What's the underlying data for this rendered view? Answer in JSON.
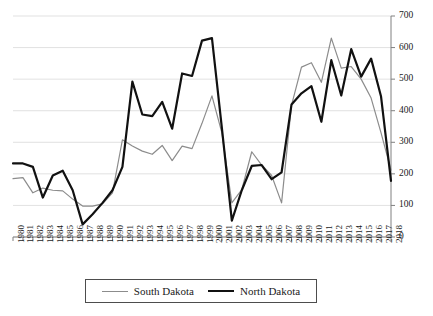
{
  "chart_data": {
    "type": "line",
    "title": "",
    "subtitle": "",
    "xlabel": "",
    "ylabel": "",
    "ylim": [
      0,
      700
    ],
    "y_ticks": [
      0,
      100,
      200,
      300,
      400,
      500,
      600,
      700
    ],
    "grid": true,
    "grid_axis": "y",
    "y_axis_position": "right",
    "legend_position": "bottom",
    "categories": [
      "1980",
      "1981",
      "1982",
      "1983",
      "1984",
      "1985",
      "1986",
      "1987",
      "1988",
      "1989",
      "1990",
      "1991",
      "1992",
      "1993",
      "1994",
      "1995",
      "1996",
      "1997",
      "1998",
      "1999",
      "2000",
      "2001",
      "2002",
      "2003",
      "2004",
      "2005",
      "2006",
      "2007",
      "2008",
      "2009",
      "2010",
      "2011",
      "2012",
      "2013",
      "2014",
      "2015",
      "2016",
      "2017",
      "2018"
    ],
    "series": [
      {
        "name": "South Dakota",
        "color": "#8c8c8c",
        "line_width": 1.2,
        "values": [
          185,
          188,
          140,
          155,
          148,
          146,
          120,
          98,
          98,
          105,
          140,
          308,
          288,
          272,
          262,
          290,
          242,
          288,
          280,
          360,
          447,
          330,
          108,
          150,
          270,
          228,
          195,
          108,
          418,
          538,
          552,
          490,
          630,
          535,
          540,
          500,
          440,
          330,
          212
        ]
      },
      {
        "name": "North Dakota",
        "color": "#111111",
        "line_width": 2.2,
        "values": [
          233,
          233,
          222,
          125,
          195,
          210,
          148,
          40,
          72,
          108,
          148,
          222,
          492,
          388,
          383,
          428,
          343,
          518,
          510,
          622,
          630,
          345,
          52,
          148,
          225,
          228,
          183,
          205,
          420,
          455,
          478,
          365,
          560,
          448,
          595,
          508,
          565,
          445,
          178
        ]
      }
    ]
  },
  "axis": {
    "y_tick_labels": [
      "700",
      "600",
      "500",
      "400",
      "300",
      "200",
      "100",
      "0"
    ],
    "x_tick_labels": [
      "1980",
      "1981",
      "1982",
      "1983",
      "1984",
      "1985",
      "1986",
      "1987",
      "1988",
      "1989",
      "1990",
      "1991",
      "1992",
      "1993",
      "1994",
      "1995",
      "1996",
      "1997",
      "1998",
      "1999",
      "2000",
      "2001",
      "2002",
      "2003",
      "2004",
      "2005",
      "2006",
      "2007",
      "2008",
      "2009",
      "2010",
      "2011",
      "2012",
      "2013",
      "2014",
      "2015",
      "2016",
      "2017",
      "2018"
    ]
  },
  "legend": {
    "entries": [
      {
        "label": "South Dakota",
        "color": "#8c8c8c"
      },
      {
        "label": "North Dakota",
        "color": "#111111"
      }
    ]
  },
  "colors": {
    "south_dakota": "#8c8c8c",
    "north_dakota": "#111111",
    "gridline": "#d9d9d9",
    "axis": "#808080",
    "background": "#ffffff"
  }
}
